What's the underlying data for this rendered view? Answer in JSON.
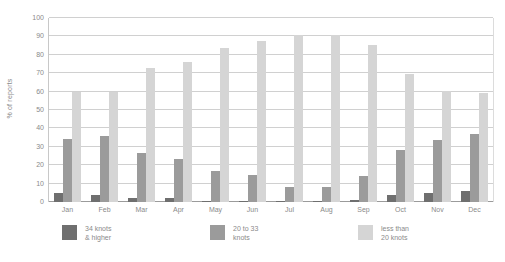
{
  "chart_data": {
    "type": "bar",
    "title": "",
    "subtitle": "",
    "xlabel": "",
    "ylabel": "% of reports",
    "ylim": [
      0,
      100
    ],
    "ytick_step": 10,
    "grid": true,
    "legend_position": "bottom",
    "categories": [
      "Jan",
      "Feb",
      "Mar",
      "Apr",
      "May",
      "Jun",
      "Jul",
      "Aug",
      "Sep",
      "Oct",
      "Nov",
      "Dec"
    ],
    "yticks": [
      "0",
      "10",
      "20",
      "30",
      "40",
      "50",
      "60",
      "70",
      "80",
      "90",
      "100"
    ],
    "series": [
      {
        "name": "34 knots\n& higher",
        "color": "#6f6f6f",
        "values": [
          5,
          4,
          2,
          2,
          0.5,
          0.5,
          0.5,
          0.5,
          1,
          4,
          5,
          6
        ]
      },
      {
        "name": "20 to 33\nknots",
        "color": "#9b9b9b",
        "values": [
          34.5,
          36,
          26.5,
          23.5,
          17,
          14.5,
          8,
          8,
          14,
          28,
          33.5,
          37
        ]
      },
      {
        "name": "less than\n20 knots",
        "color": "#d5d5d5",
        "values": [
          60,
          60,
          73,
          76,
          83.5,
          87.5,
          91,
          91,
          85.5,
          69.5,
          60.5,
          59
        ]
      }
    ]
  },
  "axis": {
    "y_title": "% of reports"
  }
}
